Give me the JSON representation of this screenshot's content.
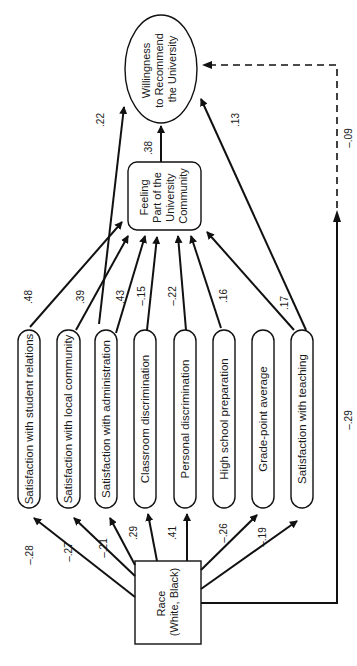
{
  "diagram": {
    "type": "path-analysis",
    "orientation": "rotated-90-ccw",
    "nodes": {
      "outcome": {
        "lines": [
          "Willingness",
          "to Recommend",
          "the University"
        ],
        "shape": "ellipse"
      },
      "mediator": {
        "lines": [
          "Feeling",
          "Part of the",
          "University",
          "Community"
        ],
        "shape": "rounded-rect"
      },
      "race": {
        "lines": [
          "Race",
          "(White, Black)"
        ],
        "shape": "rect"
      },
      "predictors": [
        {
          "label": "Satisfaction with student relations"
        },
        {
          "label": "Satisfaction with local community"
        },
        {
          "label": "Satisfaction with administration"
        },
        {
          "label": "Classroom discrimination"
        },
        {
          "label": "Personal discrimination"
        },
        {
          "label": "High school preparation"
        },
        {
          "label": "Grade-point average"
        },
        {
          "label": "Satisfaction with teaching"
        }
      ]
    },
    "edges": {
      "race_to_predictors": [
        "–.28",
        "–.27",
        "–.21",
        ".29",
        ".41",
        "–.26",
        "–.19"
      ],
      "predictors_to_mediator": [
        ".48",
        ".39",
        ".43",
        "–.15",
        "–.22",
        ".16",
        ".17"
      ],
      "admin_to_outcome": ".22",
      "teaching_to_outcome": ".13",
      "mediator_to_outcome": ".38",
      "race_to_outcome_total": "–.29",
      "race_to_outcome_direct": "–.09"
    }
  }
}
